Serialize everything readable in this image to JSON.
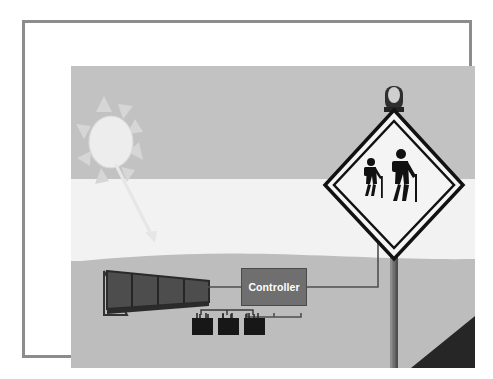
{
  "figure": {
    "type": "technical-illustration"
  },
  "illustration": {
    "labels": {
      "controller": "Controller"
    },
    "scene": {
      "sky_band_color": "#c2c2c2",
      "haze_band_color": "#f2f2f2",
      "ground_band_color": "#bdbdbd",
      "frame_border_color": "#8c8c8c",
      "page_background_color": "#ffffff"
    },
    "components": [
      {
        "name": "sun",
        "kind": "sun-icon",
        "description": "Sun with eight triangular rays",
        "color": "#ececec"
      },
      {
        "name": "sunlight-arrow",
        "kind": "arrow-icon",
        "description": "Arrow showing sunlight striking the solar panel",
        "color": "#e8e8e8"
      },
      {
        "name": "solar-panel",
        "kind": "solar-panel-icon",
        "description": "Tilted photovoltaic panel with four cell modules on an A-frame stand",
        "cells": 4,
        "color": "#4a4a4a"
      },
      {
        "name": "charge-controller",
        "kind": "controller-box",
        "label": "Controller",
        "color": "#6f6f6f"
      },
      {
        "name": "battery-bank",
        "kind": "battery-icon",
        "description": "Three batteries wired in parallel to the controller",
        "count": 3,
        "color": "#1c1c1c"
      },
      {
        "name": "warning-sign",
        "kind": "diamond-sign-icon",
        "description": "Diamond pedestrian / hiker crossing warning sign with two walking figures",
        "figures": 2,
        "color": "#111111"
      },
      {
        "name": "beacon-light",
        "kind": "beacon-lamp-icon",
        "description": "Flashing beacon lamp mounted on top of the sign post",
        "color": "#2b2b2b"
      },
      {
        "name": "sign-post",
        "kind": "post-icon",
        "description": "Vertical sign post",
        "color": "#6a6a6a"
      },
      {
        "name": "wiring",
        "kind": "wire-icon",
        "description": "Wires from panel to controller, controller to battery bank, and controller up the post to the beacon",
        "color": "#4f4f4f"
      },
      {
        "name": "foreground-slope",
        "kind": "terrain-shape",
        "description": "Dark triangular foreground embankment at the lower right",
        "color": "#2a2a2a"
      }
    ]
  }
}
